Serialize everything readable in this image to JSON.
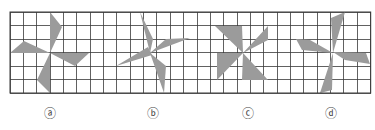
{
  "figure": {
    "grid": {
      "x0": 10,
      "y0": 12,
      "x1": 370.7,
      "y1": 93,
      "columns": 27,
      "rows": 6,
      "line_color": "#3a3a3a"
    },
    "fill_color": "#9b9b9b",
    "shapes": [
      {
        "id": "a",
        "blades": [
          "50,12 62,27 50,53",
          "10,53 24,41 50,53",
          "50,53 89,53 75,66",
          "50,53 37,80 50,93"
        ]
      },
      {
        "id": "b",
        "blades": [
          "140,12 153,39 150,53",
          "150,53 166,39 190,38",
          "116,66 148,47 152,55",
          "150,53 166,66 164,93"
        ]
      },
      {
        "id": "c",
        "blades": [
          "215,26 242,26 243,53",
          "243,53 268,26 268,40",
          "217,53 243,53 217,80",
          "243,53 268,80 242,80"
        ]
      },
      {
        "id": "d",
        "blades": [
          "331,18 345,12 333,53",
          "296,39 310,40 333,53 302,50",
          "333,52 366,53 370,64 345,60",
          "333,53 320,93 332,90"
        ]
      }
    ]
  },
  "labels": [
    {
      "text": "ⓐ",
      "x": 50
    },
    {
      "text": "ⓑ",
      "x": 153
    },
    {
      "text": "ⓒ",
      "x": 248
    },
    {
      "text": "ⓓ",
      "x": 331
    }
  ]
}
